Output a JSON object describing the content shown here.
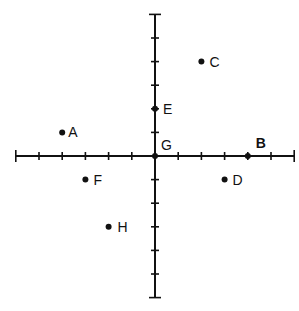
{
  "diagram": {
    "type": "coordinate-plane",
    "origin_px": [
      155,
      156
    ],
    "unit_px_x": 23.2,
    "unit_px_y": 23.6,
    "x_range": [
      -6,
      6
    ],
    "y_range": [
      -6,
      6
    ],
    "axis_color": "#111111",
    "points": [
      {
        "label": "A",
        "x": -4,
        "y": 1,
        "bold": false,
        "label_dx": 6,
        "label_dy": 5
      },
      {
        "label": "B",
        "x": 4,
        "y": 0,
        "bold": true,
        "label_dx": 8,
        "label_dy": -8
      },
      {
        "label": "C",
        "x": 2,
        "y": 4,
        "bold": false,
        "label_dx": 8,
        "label_dy": 5
      },
      {
        "label": "D",
        "x": 3,
        "y": -1,
        "bold": false,
        "label_dx": 8,
        "label_dy": 5
      },
      {
        "label": "E",
        "x": 0,
        "y": 2,
        "bold": false,
        "label_dx": 8,
        "label_dy": 5
      },
      {
        "label": "F",
        "x": -3,
        "y": -1,
        "bold": false,
        "label_dx": 8,
        "label_dy": 5
      },
      {
        "label": "G",
        "x": 0,
        "y": 0,
        "bold": false,
        "label_dx": 6,
        "label_dy": -6
      },
      {
        "label": "H",
        "x": -2,
        "y": -3,
        "bold": false,
        "label_dx": 9,
        "label_dy": 5
      }
    ]
  }
}
